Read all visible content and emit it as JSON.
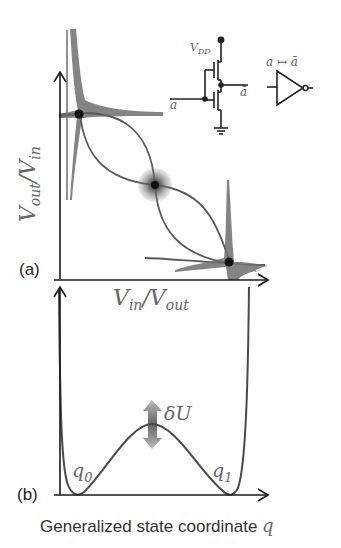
{
  "panel_a": {
    "tag": "(a)",
    "y_label": "V_out/V_in",
    "y_label_main": "V",
    "y_label_sub1": "out",
    "y_label_slash": "/V",
    "y_label_sub2": "in",
    "x_label_main": "V",
    "x_label_sub1": "in",
    "x_label_slash": "/V",
    "x_label_sub2": "out",
    "fixed_points": [
      "stable-high",
      "unstable-middle",
      "stable-low"
    ]
  },
  "circuit": {
    "supply_label": "V",
    "supply_sub": "DD",
    "input_label": "a",
    "output_label": "ā",
    "mapping_label": "a ↦ ā"
  },
  "panel_b": {
    "tag": "(b)",
    "barrier_label": "δU",
    "well_left_label": "q",
    "well_left_sub": "0",
    "well_right_label": "q",
    "well_right_sub": "1",
    "x_caption": "Generalized state coordinate",
    "x_caption_var": "q"
  },
  "colors": {
    "axis": "#1a1a1a",
    "curve": "#5a5a5a",
    "fill": "#6e6e6e",
    "label": "#666666"
  }
}
